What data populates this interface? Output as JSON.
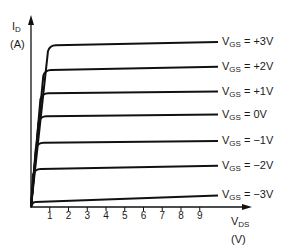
{
  "chart_data": {
    "type": "line",
    "title": "",
    "ylabel": {
      "main": "I",
      "sub": "D",
      "unit": "(A)"
    },
    "xlabel": {
      "main": "V",
      "sub": "DS",
      "unit": "(V)"
    },
    "x_ticks": [
      "1",
      "2",
      "3",
      "4",
      "5",
      "6",
      "7",
      "8",
      "9"
    ],
    "grid": false,
    "legend_position": "inline-right",
    "series": [
      {
        "name": "V_GS = +3V",
        "label_main": "V",
        "label_sub": "GS",
        "label_value": "= +3V",
        "knee_x": 1.0,
        "sat_level": 0.98,
        "end_level": 1.0
      },
      {
        "name": "V_GS = +2V",
        "label_main": "V",
        "label_sub": "GS",
        "label_value": "= +2V",
        "knee_x": 0.75,
        "sat_level": 0.83,
        "end_level": 0.85
      },
      {
        "name": "V_GS = +1V",
        "label_main": "V",
        "label_sub": "GS",
        "label_value": "= +1V",
        "knee_x": 0.6,
        "sat_level": 0.69,
        "end_level": 0.7
      },
      {
        "name": "V_GS = 0V",
        "label_main": "V",
        "label_sub": "GS",
        "label_value": "= 0V",
        "knee_x": 0.5,
        "sat_level": 0.55,
        "end_level": 0.56
      },
      {
        "name": "V_GS = -1V",
        "label_main": "V",
        "label_sub": "GS",
        "label_value": "= −1V",
        "knee_x": 0.35,
        "sat_level": 0.39,
        "end_level": 0.4
      },
      {
        "name": "V_GS = -2V",
        "label_main": "V",
        "label_sub": "GS",
        "label_value": "= −2V",
        "knee_x": 0.2,
        "sat_level": 0.23,
        "end_level": 0.25
      },
      {
        "name": "V_GS = -3V",
        "label_main": "V",
        "label_sub": "GS",
        "label_value": "= −3V",
        "knee_x": 0.1,
        "sat_level": 0.03,
        "end_level": 0.07
      }
    ],
    "colors": {
      "line": "#111111",
      "background": "#ffffff"
    }
  }
}
